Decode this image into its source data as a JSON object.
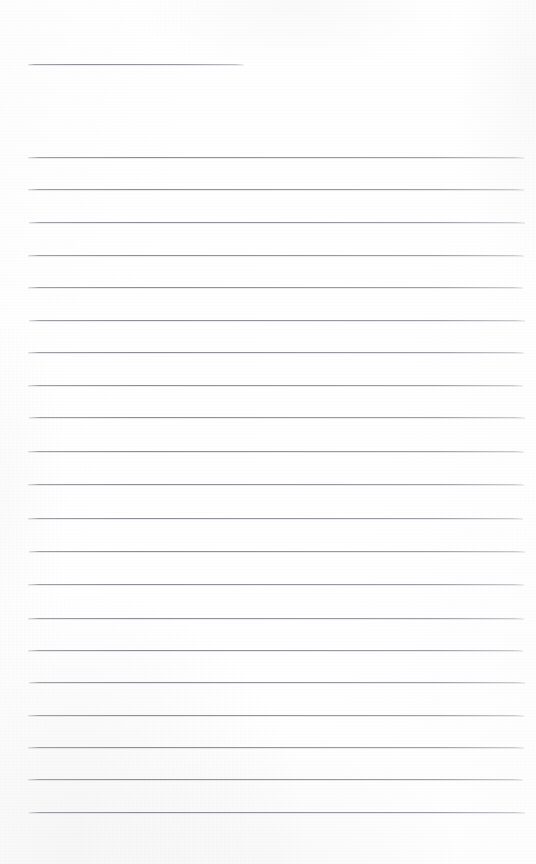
{
  "document": {
    "kind": "scanned-blank-ruled-notepad-page",
    "title_text": "",
    "body_text": "",
    "page_width": 536,
    "page_height": 864,
    "paper_color": "#fefefe",
    "rule_color": "#8e8e96",
    "rule_thickness_px": 1
  },
  "title_rule": {
    "label": "title-rule",
    "x_start": 28,
    "x_end": 244,
    "y": 64,
    "width": 216
  },
  "body_rules": {
    "count": 21,
    "x_start": 28,
    "x_end": 524,
    "first_y": 157,
    "spacing_px": 32.75,
    "lines": [
      {
        "index": 1,
        "y": 157,
        "x_start": 28,
        "x_end": 524
      },
      {
        "index": 2,
        "y": 189,
        "x_start": 28,
        "x_end": 524
      },
      {
        "index": 3,
        "y": 222,
        "x_start": 29,
        "x_end": 525
      },
      {
        "index": 4,
        "y": 255,
        "x_start": 28,
        "x_end": 524
      },
      {
        "index": 5,
        "y": 287,
        "x_start": 28,
        "x_end": 523
      },
      {
        "index": 6,
        "y": 320,
        "x_start": 29,
        "x_end": 525
      },
      {
        "index": 7,
        "y": 352,
        "x_start": 28,
        "x_end": 524
      },
      {
        "index": 8,
        "y": 385,
        "x_start": 28,
        "x_end": 523
      },
      {
        "index": 9,
        "y": 417,
        "x_start": 29,
        "x_end": 525
      },
      {
        "index": 10,
        "y": 451,
        "x_start": 28,
        "x_end": 524
      },
      {
        "index": 11,
        "y": 484,
        "x_start": 28,
        "x_end": 524
      },
      {
        "index": 12,
        "y": 518,
        "x_start": 28,
        "x_end": 523
      },
      {
        "index": 13,
        "y": 551,
        "x_start": 29,
        "x_end": 525
      },
      {
        "index": 14,
        "y": 584,
        "x_start": 28,
        "x_end": 524
      },
      {
        "index": 15,
        "y": 618,
        "x_start": 28,
        "x_end": 524
      },
      {
        "index": 16,
        "y": 650,
        "x_start": 28,
        "x_end": 523
      },
      {
        "index": 17,
        "y": 682,
        "x_start": 29,
        "x_end": 525
      },
      {
        "index": 18,
        "y": 715,
        "x_start": 28,
        "x_end": 524
      },
      {
        "index": 19,
        "y": 747,
        "x_start": 28,
        "x_end": 524
      },
      {
        "index": 20,
        "y": 779,
        "x_start": 28,
        "x_end": 523
      },
      {
        "index": 21,
        "y": 812,
        "x_start": 29,
        "x_end": 525
      }
    ]
  }
}
